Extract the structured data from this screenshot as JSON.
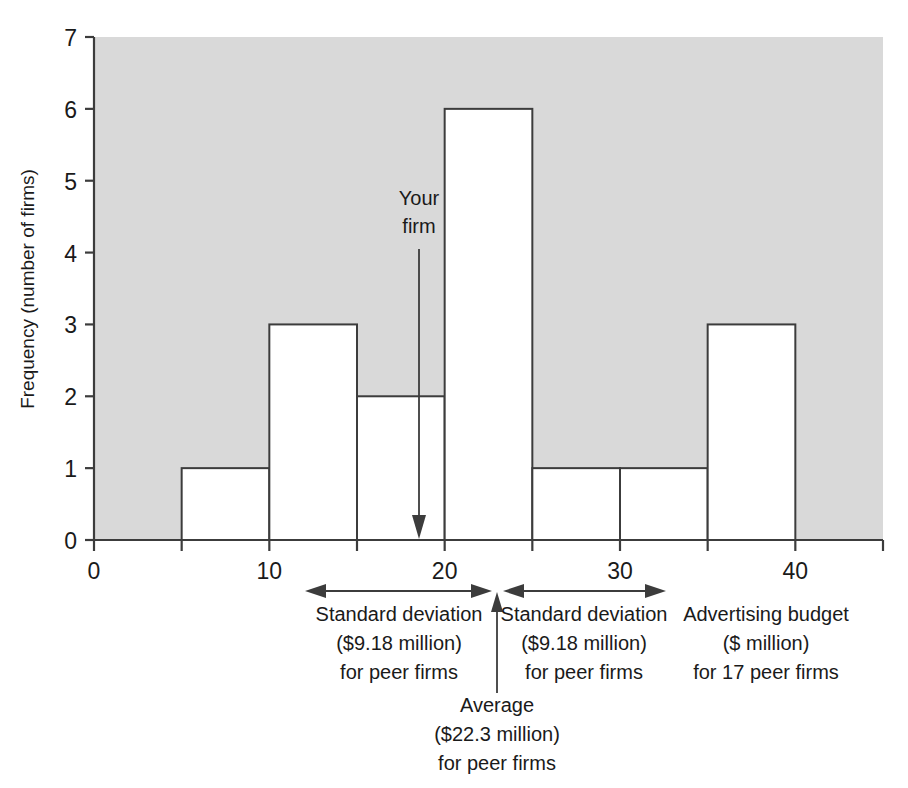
{
  "figure": {
    "background_color": "#ffffff",
    "plot_fill_color": "#d9d9d9",
    "bar_fill_color": "#ffffff",
    "line_color": "#3c3c3c"
  },
  "chart_data": {
    "type": "bar",
    "title": "",
    "xlabel": "Advertising budget ($ million) for 17 peer firms",
    "ylabel": "Frequency (number of firms)",
    "xlim": [
      0,
      45
    ],
    "ylim": [
      0,
      7
    ],
    "grid": false,
    "legend": null,
    "bin_width": 5,
    "categories": [
      "0-5",
      "5-10",
      "10-15",
      "15-20",
      "20-25",
      "25-30",
      "30-35",
      "35-40",
      "40-45"
    ],
    "bin_edges": [
      0,
      5,
      10,
      15,
      20,
      25,
      30,
      35,
      40,
      45
    ],
    "values": [
      0,
      1,
      3,
      2,
      6,
      1,
      1,
      3,
      0
    ],
    "x_ticks": [
      0,
      10,
      20,
      30,
      40
    ],
    "x_tick_labels": [
      "0",
      "10",
      "20",
      "30",
      "40"
    ],
    "x_minor_ticks": [
      5,
      15,
      25,
      35,
      45
    ],
    "y_ticks": [
      0,
      1,
      2,
      3,
      4,
      5,
      6,
      7
    ],
    "y_tick_labels": [
      "0",
      "1",
      "2",
      "3",
      "4",
      "5",
      "6",
      "7"
    ],
    "annotations": {
      "your_firm": {
        "label_line1": "Your",
        "label_line2": "firm",
        "value": 18.5,
        "arrow": "down"
      },
      "average": {
        "label_line1": "Average",
        "label_line2": "($22.3 million)",
        "label_line3": "for peer firms",
        "value": 22.3,
        "arrow": "up"
      },
      "std_dev_left": {
        "label_line1": "Standard deviation",
        "label_line2": "($9.18 million)",
        "label_line3": "for peer firms",
        "from": 13.12,
        "to": 22.3,
        "arrow": "double"
      },
      "std_dev_right": {
        "label_line1": "Standard deviation",
        "label_line2": "($9.18 million)",
        "label_line3": "for peer firms",
        "from": 22.3,
        "to": 31.48,
        "arrow": "double"
      },
      "x_axis_caption": {
        "label_line1": "Advertising budget",
        "label_line2": "($ million)",
        "label_line3": "for 17 peer firms"
      }
    }
  }
}
